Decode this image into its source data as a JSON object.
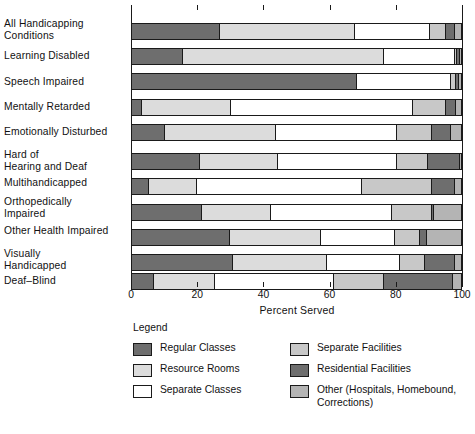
{
  "chart_data": {
    "type": "bar",
    "orientation": "horizontal",
    "stacked": true,
    "title": "",
    "xlabel": "Percent Served",
    "ylabel": "",
    "xlim": [
      0,
      100
    ],
    "xticks": [
      0,
      20,
      40,
      60,
      80,
      100
    ],
    "xticklabels": [
      "0",
      "20",
      "40",
      "60",
      "80",
      "100"
    ],
    "grid": false,
    "legend_position": "bottom",
    "legend_title": "Legend",
    "categories": [
      "All Handicapping Conditions",
      "Learning Disabled",
      "Speech Impaired",
      "Mentally Retarded",
      "Emotionally Disturbed",
      "Hard of Hearing and Deaf",
      "Multihandicapped",
      "Orthopedically Impaired",
      "Other Health Impaired",
      "Visually Handicapped",
      "Deaf-Blind"
    ],
    "series": [
      {
        "name": "Regular Classes",
        "color": "#6e6e6e",
        "values": [
          26.5,
          15.5,
          68.0,
          3.0,
          10.0,
          20.5,
          5.0,
          21.0,
          29.5,
          30.5,
          6.5
        ]
      },
      {
        "name": "Resource Rooms",
        "color": "#dcdcdc",
        "values": [
          41.0,
          60.5,
          0.0,
          27.0,
          33.5,
          23.5,
          14.5,
          21.0,
          27.5,
          28.5,
          18.5
        ]
      },
      {
        "name": "Separate Classes",
        "color": "#ffffff",
        "values": [
          22.5,
          21.5,
          28.5,
          55.0,
          36.5,
          36.0,
          50.0,
          36.5,
          22.5,
          22.0,
          36.0
        ]
      },
      {
        "name": "Separate Facilities",
        "color": "#c8c8c8",
        "values": [
          5.0,
          0.8,
          1.5,
          10.0,
          10.5,
          9.5,
          21.0,
          12.0,
          7.5,
          7.5,
          15.0
        ]
      },
      {
        "name": "Residential Facilities",
        "color": "#6e6e6e",
        "values": [
          2.5,
          0.7,
          0.7,
          3.0,
          6.0,
          9.5,
          7.0,
          0.7,
          2.0,
          9.0,
          21.0
        ]
      },
      {
        "name": "Other (Hospitals, Homebound, Corrections)",
        "color": "#b4b4b4",
        "values": [
          2.5,
          1.0,
          1.3,
          2.0,
          3.5,
          1.0,
          2.5,
          8.8,
          11.0,
          2.5,
          3.0
        ]
      }
    ]
  },
  "axis": {
    "xlabel": "Percent Served",
    "ticks": [
      "0",
      "20",
      "40",
      "60",
      "80",
      "100"
    ]
  },
  "categories": [
    {
      "lines": [
        "All Handicapping",
        "Conditions"
      ]
    },
    {
      "lines": [
        "Learning Disabled"
      ]
    },
    {
      "lines": [
        "Speech Impaired"
      ]
    },
    {
      "lines": [
        "Mentally Retarded"
      ]
    },
    {
      "lines": [
        "Emotionally Disturbed"
      ]
    },
    {
      "lines": [
        "Hard of",
        "Hearing and Deaf"
      ]
    },
    {
      "lines": [
        "Multihandicapped"
      ]
    },
    {
      "lines": [
        "Orthopedically",
        "Impaired"
      ]
    },
    {
      "lines": [
        "Other Health Impaired"
      ]
    },
    {
      "lines": [
        "Visually",
        "Handicapped"
      ]
    },
    {
      "lines": [
        "Deaf–Blind"
      ]
    }
  ],
  "legend": {
    "title": "Legend",
    "columns": [
      [
        {
          "label": "Regular Classes",
          "label2": "",
          "color": "#6e6e6e"
        },
        {
          "label": "Resource Rooms",
          "label2": "",
          "color": "#dcdcdc"
        },
        {
          "label": "Separate Classes",
          "label2": "",
          "color": "#ffffff"
        }
      ],
      [
        {
          "label": "Separate Facilities",
          "label2": "",
          "color": "#c8c8c8"
        },
        {
          "label": "Residential Facilities",
          "label2": "",
          "color": "#6e6e6e"
        },
        {
          "label": "Other (Hospitals, Homebound,",
          "label2": "Corrections)",
          "color": "#b4b4b4"
        }
      ]
    ]
  },
  "caption": ""
}
